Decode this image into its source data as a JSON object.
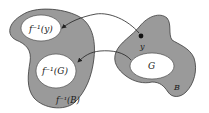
{
  "diagram": {
    "type": "preimage-mapping",
    "colors": {
      "region_fill": "#9a9a9a",
      "region_stroke": "#3a3a3a",
      "hole_fill": "#ffffff",
      "arrow": "#222222",
      "point": "#111111",
      "text": "#1a1a1a"
    },
    "left_region": {
      "label": "f⁻¹(B)",
      "sets": [
        {
          "id": "preimage-y",
          "label": "f⁻¹(y)"
        },
        {
          "id": "preimage-G",
          "label": "f⁻¹(G)"
        }
      ]
    },
    "right_region": {
      "label": "B",
      "point_label": "y",
      "subset_label": "G"
    },
    "arrows": [
      {
        "from": "y",
        "to": "f⁻¹(y)"
      },
      {
        "from": "G",
        "to": "f⁻¹(G)"
      }
    ]
  }
}
